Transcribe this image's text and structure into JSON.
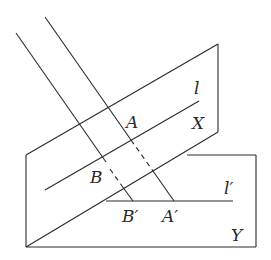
{
  "diagram": {
    "labels": {
      "l": "l",
      "X": "X",
      "A": "A",
      "B": "B",
      "l_prime": "l′",
      "B_prime": "B′",
      "A_prime": "A′",
      "Y": "Y"
    },
    "colors": {
      "stroke": "#2a2a2a",
      "background": "#ffffff"
    }
  }
}
